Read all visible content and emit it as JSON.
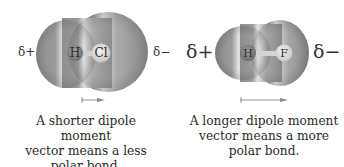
{
  "figure": {
    "molecules": [
      {
        "id": "HCl",
        "atoms": [
          {
            "symbol": "H"
          },
          {
            "symbol": "Cl"
          }
        ],
        "partial_charge_left": "δ+",
        "partial_charge_right": "δ−",
        "dipole_vector": "short",
        "caption_lines": [
          "A shorter dipole moment",
          "vector means a less",
          "polar bond."
        ]
      },
      {
        "id": "HF",
        "atoms": [
          {
            "symbol": "H"
          },
          {
            "symbol": "F"
          }
        ],
        "partial_charge_left": "δ+",
        "partial_charge_right": "δ−",
        "dipole_vector": "long",
        "caption_lines": [
          "A longer dipole moment",
          "vector means a more",
          "polar bond."
        ]
      }
    ],
    "colors": {
      "surface_dark": "#8a8a8a",
      "surface_light": "#e6e6e6",
      "atom_H": "#7d7d7d",
      "atom_Cl": "#d8d8d8",
      "arrow": "#888888"
    }
  }
}
